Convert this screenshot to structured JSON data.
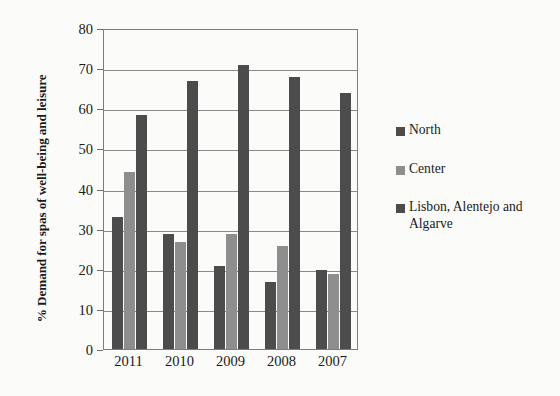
{
  "chart_data": {
    "type": "bar",
    "title": "",
    "subtitle": "",
    "xlabel": "",
    "ylabel": "% Demand for spas of well-being and leisure",
    "categories": [
      "2011",
      "2010",
      "2009",
      "2008",
      "2007"
    ],
    "series": [
      {
        "name": "North",
        "color": "#4c4c4c",
        "values": [
          32.8,
          28.7,
          20.7,
          16.7,
          19.8
        ]
      },
      {
        "name": "Center",
        "color": "#8e8e8e",
        "values": [
          44.2,
          26.6,
          28.7,
          25.6,
          18.8
        ]
      },
      {
        "name": "Lisbon, Alentejo and Algarve",
        "color": "#4c4c4c",
        "values": [
          58.2,
          66.7,
          70.8,
          67.8,
          63.9
        ]
      }
    ],
    "ylim": [
      0,
      80
    ],
    "ytick_values": [
      0,
      10,
      20,
      30,
      40,
      50,
      60,
      70,
      80
    ],
    "ytick_labels": [
      "0",
      "10",
      "20",
      "30",
      "40",
      "50",
      "60",
      "70",
      "80"
    ],
    "grid": true,
    "grid_axis": "y",
    "legend_position": "right",
    "legend": [
      {
        "label": "North",
        "color": "#4c4c4c"
      },
      {
        "label": "Center",
        "color": "#8e8e8e"
      },
      {
        "label": "Lisbon, Alentejo and Algarve",
        "color": "#4c4c4c"
      }
    ],
    "background_color": "#fbfbfa",
    "axis_color": "#7d7d7d",
    "gridline_color": "#8a8a8a"
  }
}
